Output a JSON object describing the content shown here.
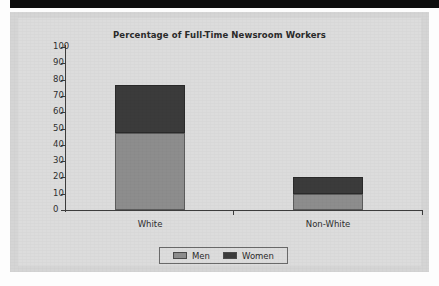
{
  "page": {
    "top_band_color": "#0d0d0d",
    "panel_bg_color": "#d5d5d5",
    "plate_bg_color": "#dcdcdc"
  },
  "chart_data": {
    "type": "bar",
    "subtype": "stacked-bar",
    "title": "Percentage of Full-Time Newsroom Workers",
    "xlabel": "",
    "ylabel": "",
    "categories": [
      "White",
      "Non-White"
    ],
    "series": [
      {
        "name": "Men",
        "values": [
          47,
          10
        ],
        "color": "#8d8d8d"
      },
      {
        "name": "Women",
        "values": [
          30,
          10
        ],
        "color": "#3b3b3b"
      }
    ],
    "totals": [
      77,
      20
    ],
    "ylim": [
      0,
      100
    ],
    "ytick_values": [
      100,
      90,
      80,
      70,
      60,
      50,
      40,
      30,
      20,
      10,
      0
    ],
    "ytick_labels": [
      "100",
      "90",
      "80",
      "70",
      "60",
      "50",
      "40",
      "30",
      "20",
      "10",
      "0"
    ],
    "grid": false,
    "legend_position": "bottom-center",
    "legend_entries": [
      "Men",
      "Women"
    ]
  }
}
